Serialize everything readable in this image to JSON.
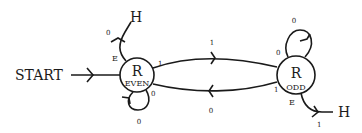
{
  "diagram": {
    "type": "state-machine",
    "start_label": "START",
    "states": [
      {
        "id": "even",
        "top": "R",
        "bottom": "EVEN"
      },
      {
        "id": "odd",
        "top": "R",
        "bottom": "ODD"
      }
    ],
    "halt_label": "H",
    "transitions": {
      "even_to_odd": {
        "read": "1",
        "label": "1"
      },
      "odd_to_even": {
        "read": "1",
        "label": "0"
      },
      "even_self": {
        "read": "0",
        "label": "0"
      },
      "odd_self": {
        "read": "0",
        "label": "0"
      },
      "even_halt": {
        "read": "E",
        "label": "0"
      },
      "odd_halt": {
        "read": "E",
        "label": "1"
      }
    },
    "colors": {
      "stroke": "#1a1a1a",
      "background": "#ffffff"
    }
  }
}
